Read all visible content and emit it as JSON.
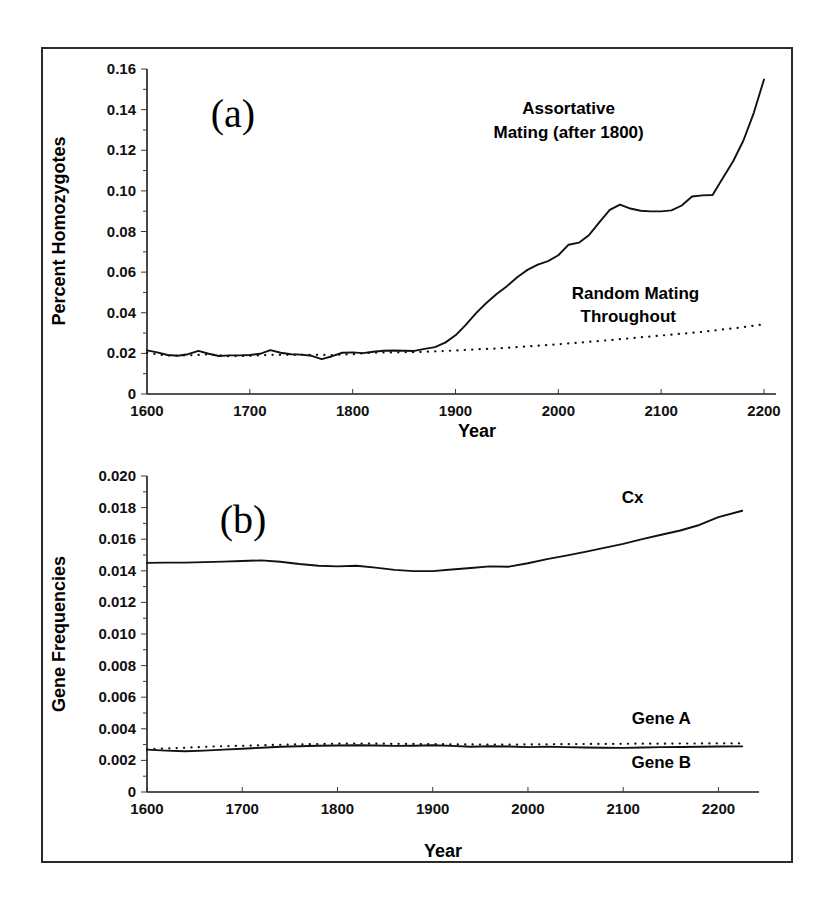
{
  "figure": {
    "background": "#ffffff",
    "frame_color": "#2b2b2b",
    "panel_a_letter": "(a)",
    "panel_b_letter": "(b)"
  },
  "chart_data": [
    {
      "panel": "(a)",
      "type": "line",
      "title": "",
      "xlabel": "Year",
      "ylabel": "Percent Homozygotes",
      "xlim": [
        1600,
        2200
      ],
      "ylim": [
        0,
        0.16
      ],
      "xticks": [
        1600,
        1700,
        1800,
        1900,
        2000,
        2100,
        2200
      ],
      "xticklabels": [
        "1600",
        "1700",
        "1800",
        "1900",
        "2000",
        "2100",
        "2200"
      ],
      "yticks": [
        0,
        0.02,
        0.04,
        0.06,
        0.08,
        0.1,
        0.12,
        0.14,
        0.16
      ],
      "yticklabels": [
        "0",
        "0.02",
        "0.04",
        "0.06",
        "0.08",
        "0.10",
        "0.12",
        "0.14",
        "0.16"
      ],
      "grid": false,
      "legend_position": "inline-annotations",
      "annotations": [
        {
          "text": "Assortative",
          "x": 2010,
          "y": 0.138
        },
        {
          "text": "Mating (after 1800)",
          "x": 2010,
          "y": 0.126
        },
        {
          "text": "Random Mating",
          "x": 2075,
          "y": 0.047
        },
        {
          "text": "Throughout",
          "x": 2068,
          "y": 0.0355
        }
      ],
      "series": [
        {
          "name": "Assortative Mating (after 1800)",
          "style": "solid",
          "x": [
            1600,
            1610,
            1620,
            1630,
            1640,
            1650,
            1660,
            1670,
            1680,
            1690,
            1700,
            1710,
            1720,
            1730,
            1740,
            1750,
            1760,
            1770,
            1780,
            1790,
            1800,
            1810,
            1820,
            1830,
            1840,
            1850,
            1860,
            1870,
            1880,
            1890,
            1900,
            1910,
            1920,
            1930,
            1940,
            1950,
            1960,
            1970,
            1980,
            1990,
            2000,
            2010,
            2020,
            2030,
            2040,
            2050,
            2060,
            2070,
            2080,
            2090,
            2100,
            2110,
            2120,
            2130,
            2140,
            2150,
            2160,
            2170,
            2180,
            2190,
            2200
          ],
          "y": [
            0.0215,
            0.0205,
            0.0192,
            0.0188,
            0.0196,
            0.0212,
            0.0198,
            0.0187,
            0.019,
            0.019,
            0.0192,
            0.0198,
            0.0216,
            0.0203,
            0.0196,
            0.0194,
            0.0188,
            0.0172,
            0.0186,
            0.0203,
            0.0205,
            0.0201,
            0.0208,
            0.0213,
            0.0214,
            0.0213,
            0.0212,
            0.0222,
            0.0231,
            0.0253,
            0.0289,
            0.034,
            0.0398,
            0.0448,
            0.0492,
            0.0531,
            0.0575,
            0.0611,
            0.0637,
            0.0654,
            0.0683,
            0.0735,
            0.0745,
            0.0783,
            0.0846,
            0.0906,
            0.0932,
            0.0913,
            0.0902,
            0.0899,
            0.0899,
            0.0904,
            0.0928,
            0.0972,
            0.0978,
            0.098,
            0.1063,
            0.1146,
            0.1248,
            0.1383,
            0.1548
          ]
        },
        {
          "name": "Random Mating Throughout",
          "style": "dotted",
          "x": [
            1600,
            1620,
            1640,
            1660,
            1680,
            1700,
            1720,
            1740,
            1760,
            1780,
            1800,
            1820,
            1840,
            1860,
            1880,
            1900,
            1920,
            1940,
            1960,
            1980,
            2000,
            2020,
            2040,
            2060,
            2080,
            2100,
            2120,
            2140,
            2160,
            2180,
            2200
          ],
          "y": [
            0.0203,
            0.0189,
            0.019,
            0.0195,
            0.0186,
            0.0188,
            0.0193,
            0.0193,
            0.0193,
            0.0192,
            0.0196,
            0.0204,
            0.0205,
            0.0206,
            0.021,
            0.0214,
            0.022,
            0.0224,
            0.0231,
            0.0238,
            0.0245,
            0.0253,
            0.0261,
            0.027,
            0.0279,
            0.0288,
            0.0297,
            0.0306,
            0.0318,
            0.0329,
            0.0343
          ]
        }
      ]
    },
    {
      "panel": "(b)",
      "type": "line",
      "title": "",
      "xlabel": "Year",
      "ylabel": "Gene Frequencies",
      "xlim": [
        1600,
        2230
      ],
      "ylim": [
        0,
        0.02
      ],
      "xticks": [
        1600,
        1700,
        1800,
        1900,
        2000,
        2100,
        2200
      ],
      "xticklabels": [
        "1600",
        "1700",
        "1800",
        "1900",
        "2000",
        "2100",
        "2200"
      ],
      "yticks": [
        0,
        0.002,
        0.004,
        0.006,
        0.008,
        0.01,
        0.012,
        0.014,
        0.016,
        0.018,
        0.02
      ],
      "yticklabels": [
        "0",
        "0.002",
        "0.004",
        "0.006",
        "0.008",
        "0.010",
        "0.012",
        "0.014",
        "0.016",
        "0.018",
        "0.020"
      ],
      "grid": false,
      "legend_position": "inline-annotations",
      "annotations": [
        {
          "text": "Cx",
          "x": 2110,
          "y": 0.0183
        },
        {
          "text": "Gene A",
          "x": 2140,
          "y": 0.0043
        },
        {
          "text": "Gene B",
          "x": 2140,
          "y": 0.0015
        }
      ],
      "series": [
        {
          "name": "Cx",
          "style": "solid",
          "x": [
            1600,
            1620,
            1640,
            1660,
            1680,
            1700,
            1720,
            1740,
            1760,
            1780,
            1800,
            1820,
            1840,
            1860,
            1880,
            1900,
            1920,
            1940,
            1960,
            1980,
            2000,
            2020,
            2040,
            2060,
            2080,
            2100,
            2120,
            2140,
            2160,
            2180,
            2200,
            2225
          ],
          "y": [
            0.0145,
            0.01452,
            0.01452,
            0.01455,
            0.01458,
            0.01462,
            0.01466,
            0.01457,
            0.01443,
            0.01432,
            0.01428,
            0.01432,
            0.0142,
            0.01406,
            0.01398,
            0.01398,
            0.01408,
            0.01418,
            0.01428,
            0.01426,
            0.01448,
            0.01474,
            0.01496,
            0.0152,
            0.01545,
            0.0157,
            0.016,
            0.01628,
            0.01655,
            0.0169,
            0.0174,
            0.0178
          ]
        },
        {
          "name": "Gene A",
          "style": "dotted",
          "x": [
            1600,
            1620,
            1640,
            1660,
            1680,
            1700,
            1720,
            1740,
            1760,
            1780,
            1800,
            1820,
            1840,
            1860,
            1880,
            1900,
            1920,
            1940,
            1960,
            1980,
            2000,
            2020,
            2040,
            2060,
            2080,
            2100,
            2120,
            2140,
            2160,
            2180,
            2200,
            2225
          ],
          "y": [
            0.00272,
            0.00276,
            0.0028,
            0.00286,
            0.0029,
            0.00292,
            0.00296,
            0.00299,
            0.00302,
            0.00304,
            0.00306,
            0.00307,
            0.00306,
            0.00305,
            0.00304,
            0.00303,
            0.00302,
            0.00301,
            0.003,
            0.003,
            0.00301,
            0.00302,
            0.00303,
            0.00304,
            0.00304,
            0.00305,
            0.00306,
            0.00306,
            0.00307,
            0.00307,
            0.00308,
            0.00308
          ]
        },
        {
          "name": "Gene B",
          "style": "solid",
          "x": [
            1600,
            1620,
            1640,
            1660,
            1680,
            1700,
            1720,
            1740,
            1760,
            1780,
            1800,
            1820,
            1840,
            1860,
            1880,
            1900,
            1920,
            1940,
            1960,
            1980,
            2000,
            2020,
            2040,
            2060,
            2080,
            2100,
            2120,
            2140,
            2160,
            2180,
            2200,
            2225
          ],
          "y": [
            0.00268,
            0.00262,
            0.00258,
            0.00262,
            0.00268,
            0.00274,
            0.0028,
            0.00286,
            0.0029,
            0.00293,
            0.00294,
            0.00296,
            0.00294,
            0.00292,
            0.00293,
            0.00296,
            0.00292,
            0.00286,
            0.0029,
            0.00288,
            0.00284,
            0.00287,
            0.00284,
            0.00282,
            0.0028,
            0.00279,
            0.00282,
            0.00284,
            0.00285,
            0.00286,
            0.00288,
            0.00289
          ]
        }
      ]
    }
  ]
}
